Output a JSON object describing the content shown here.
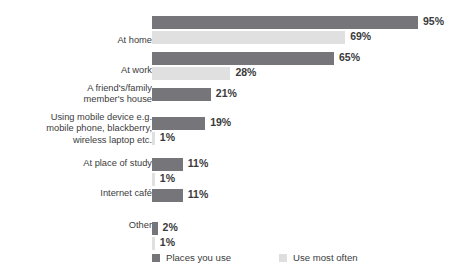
{
  "chart_data": {
    "type": "bar",
    "orientation": "horizontal",
    "title": "",
    "subtitle": "",
    "xlabel": "",
    "ylabel": "",
    "xlim": [
      0,
      100
    ],
    "grid": false,
    "value_suffix": "%",
    "legend_position": "bottom-left",
    "categories": [
      "At home",
      "At work",
      "A friend's/family\nmember's house",
      "Using mobile device e.g.\nmobile phone, blackberry,\nwireless laptop etc.",
      "At place of study",
      "Internet café",
      "Other"
    ],
    "series": [
      {
        "name": "Places you use",
        "color": "#76767a",
        "values": [
          95,
          65,
          21,
          19,
          11,
          11,
          2
        ],
        "labels": [
          "95%",
          "65%",
          "21%",
          "19%",
          "11%",
          "11%",
          "2%"
        ]
      },
      {
        "name": "Use most often",
        "color": "#e0e0e0",
        "values": [
          69,
          28,
          null,
          1,
          1,
          null,
          1
        ],
        "labels": [
          "69%",
          "28%",
          null,
          "1%",
          "1%",
          null,
          "1%"
        ]
      }
    ]
  },
  "legend": {
    "items": [
      {
        "label": "Places you use",
        "color": "#76767a"
      },
      {
        "label": "Use most often",
        "color": "#e0e0e0"
      }
    ]
  }
}
